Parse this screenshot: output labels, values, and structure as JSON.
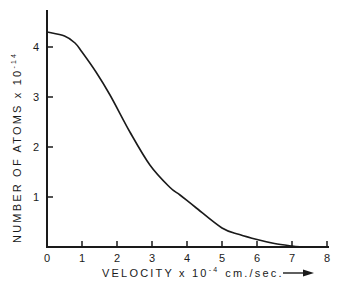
{
  "chart_data": {
    "type": "line",
    "title": "",
    "xlabel": "VELOCITY x 10^-4 cm./sec.",
    "xlabel_parts": {
      "main": "VELOCITY  x  10",
      "exp": "-4",
      "unit": "cm./sec."
    },
    "ylabel": "NUMBER OF ATOMS x 10^-14",
    "ylabel_parts": {
      "main": "NUMBER  OF  ATOMS  x  10",
      "exp": "-14"
    },
    "xlim": [
      0,
      8
    ],
    "ylim": [
      0,
      4.75
    ],
    "x_ticks": [
      0,
      1,
      2,
      3,
      4,
      5,
      6,
      7,
      8
    ],
    "x_tick_labels": [
      "0",
      "1",
      "2",
      "3",
      "4",
      "5",
      "6",
      "7",
      "8"
    ],
    "y_ticks": [
      1,
      2,
      3,
      4
    ],
    "y_tick_labels": [
      "1",
      "2",
      "3",
      "4"
    ],
    "grid": false,
    "legend": null,
    "series": [
      {
        "name": "Number of atoms vs velocity",
        "color": "#1a1a1a",
        "x": [
          0,
          0.5,
          0.8,
          1.0,
          1.4,
          1.8,
          2.37,
          2.94,
          3.5,
          3.8,
          4.23,
          5.0,
          5.5,
          6.0,
          6.5,
          7.0,
          7.3
        ],
        "y": [
          4.3,
          4.22,
          4.08,
          3.9,
          3.5,
          3.04,
          2.3,
          1.64,
          1.2,
          1.04,
          0.8,
          0.38,
          0.25,
          0.15,
          0.07,
          0.02,
          0.0
        ]
      }
    ],
    "annotations": [
      "arrow pointing right after x-axis label"
    ]
  },
  "layout": {
    "origin_px": [
      47,
      247
    ],
    "x_px_per_unit": 35,
    "y_px_per_unit": 50,
    "y_axis_top_px": 10,
    "x_axis_right_px": 329
  }
}
